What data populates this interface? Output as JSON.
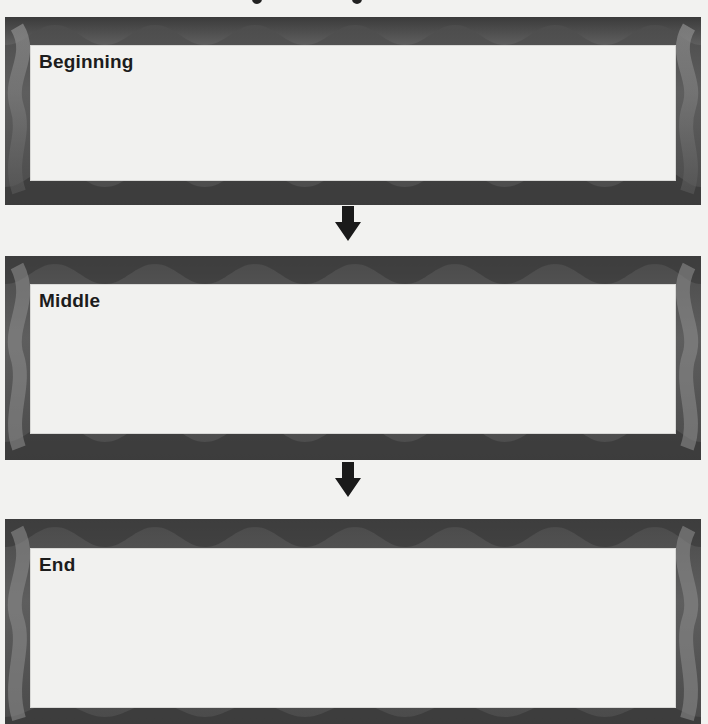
{
  "panels": [
    {
      "id": "beginning",
      "label": "Beginning"
    },
    {
      "id": "middle",
      "label": "Middle"
    },
    {
      "id": "end",
      "label": "End"
    }
  ],
  "icons": {
    "arrow": "down-arrow-icon"
  },
  "colors": {
    "frame_dark": "#3e3e3e",
    "frame_light": "#8a8a8a",
    "inner_fill": "#f1f1ef",
    "label": "#1c1c1c",
    "arrow": "#1a1a1a"
  }
}
